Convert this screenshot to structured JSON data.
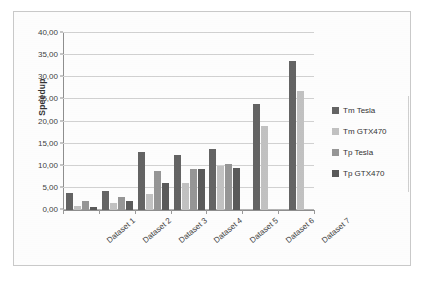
{
  "chart_data": {
    "type": "bar",
    "title": "",
    "xlabel": "",
    "ylabel": "Speedup",
    "ylim": [
      0,
      40
    ],
    "ytick_step": 5,
    "grid": true,
    "legend_position": "right",
    "decimal_separator": ",",
    "categories": [
      "Dataset 1",
      "Dataset 2",
      "Dataset 3",
      "Dataset 4",
      "Dataset 5",
      "Dataset 6",
      "Dataset 7"
    ],
    "ytick_labels": [
      "0,00",
      "5,00",
      "10,00",
      "15,00",
      "20,00",
      "25,00",
      "30,00",
      "35,00",
      "40,00"
    ],
    "ytick_values": [
      0,
      5,
      10,
      15,
      20,
      25,
      30,
      35,
      40
    ],
    "series": [
      {
        "name": "Tm Tesla",
        "color": "#646464",
        "values": [
          3.9,
          4.25,
          13.2,
          12.5,
          13.8,
          23.9,
          33.6
        ]
      },
      {
        "name": "Tm GTX470",
        "color": "#c2c2c2",
        "values": [
          0.85,
          1.6,
          3.55,
          6.2,
          9.95,
          18.9,
          26.8
        ]
      },
      {
        "name": "Tp Tesla",
        "color": "#969696",
        "values": [
          2.05,
          2.85,
          8.8,
          9.2,
          10.5,
          null,
          null
        ]
      },
      {
        "name": "Tp GTX470",
        "color": "#5a5a5a",
        "values": [
          0.6,
          1.95,
          6.2,
          9.2,
          9.6,
          null,
          null
        ]
      }
    ]
  },
  "legend": {
    "items": [
      {
        "label": "Tm Tesla",
        "color": "#646464"
      },
      {
        "label": "Tm GTX470",
        "color": "#c2c2c2"
      },
      {
        "label": "Tp Tesla",
        "color": "#969696"
      },
      {
        "label": "Tp GTX470",
        "color": "#5a5a5a"
      }
    ]
  }
}
